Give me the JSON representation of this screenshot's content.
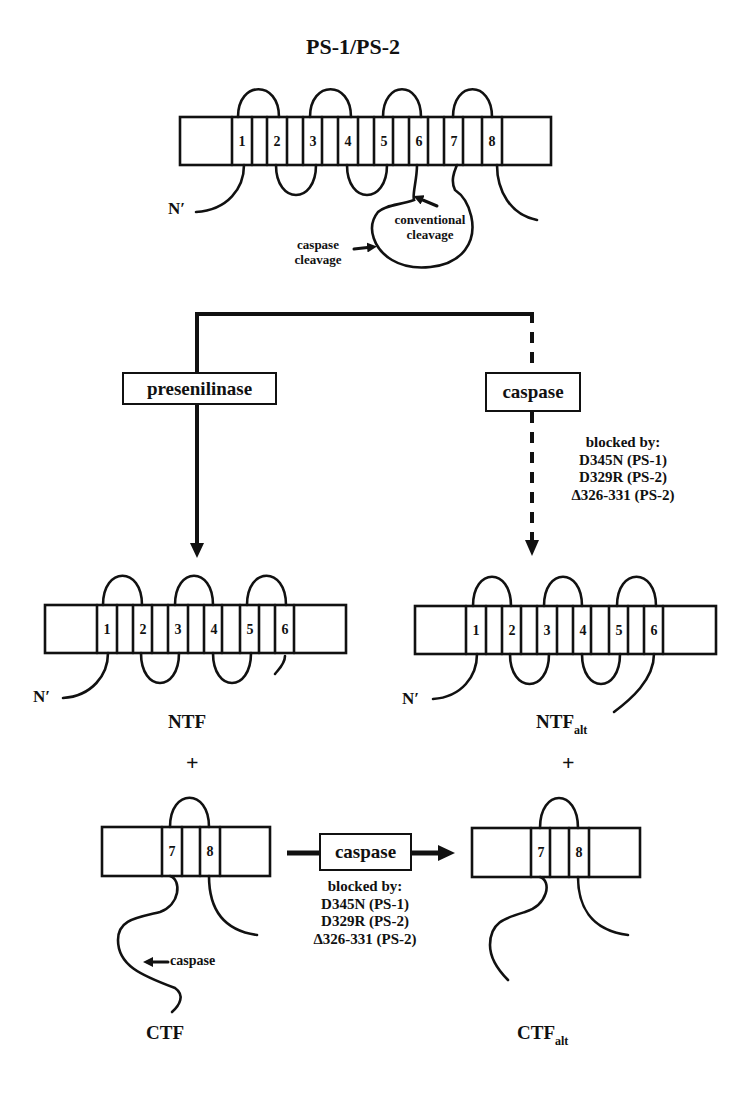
{
  "title": "PS-1/PS-2",
  "top": {
    "segments": [
      "1",
      "2",
      "3",
      "4",
      "5",
      "6",
      "7",
      "8"
    ],
    "n_term": "N′",
    "conventional_cleavage": [
      "conventional",
      "cleavage"
    ],
    "caspase_cleavage": [
      "caspase",
      "cleavage"
    ]
  },
  "left_branch": {
    "enzyme": "presenilinase"
  },
  "right_branch": {
    "enzyme": "caspase",
    "blocked_by": [
      "blocked by:",
      "D345N (PS-1)",
      "D329R (PS-2)",
      "Δ326-331 (PS-2)"
    ]
  },
  "ntf": {
    "segments": [
      "1",
      "2",
      "3",
      "4",
      "5",
      "6"
    ],
    "n_term": "N′",
    "label": "NTF",
    "plus": "+"
  },
  "ntf_alt": {
    "segments": [
      "1",
      "2",
      "3",
      "4",
      "5",
      "6"
    ],
    "n_term": "N′",
    "label": "NTF",
    "label_sub": "alt",
    "plus": "+"
  },
  "ctf": {
    "segments": [
      "7",
      "8"
    ],
    "caspase_site": "caspase",
    "label": "CTF"
  },
  "ctf_conversion": {
    "enzyme": "caspase",
    "blocked_by": [
      "blocked by:",
      "D345N (PS-1)",
      "D329R (PS-2)",
      "Δ326-331 (PS-2)"
    ]
  },
  "ctf_alt": {
    "segments": [
      "7",
      "8"
    ],
    "label": "CTF",
    "label_sub": "alt"
  }
}
